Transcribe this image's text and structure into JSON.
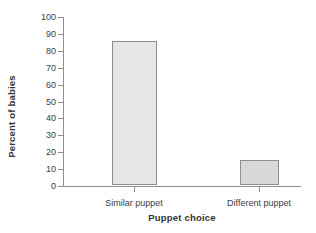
{
  "chart_data": {
    "type": "bar",
    "title": "",
    "xlabel": "Puppet choice",
    "ylabel": "Percent of babies",
    "categories": [
      "Similar puppet",
      "Different puppet"
    ],
    "values": [
      85,
      15
    ],
    "ylim": [
      0,
      100
    ],
    "yticks": [
      0,
      10,
      20,
      30,
      40,
      50,
      60,
      70,
      80,
      90,
      100
    ],
    "ytick_labels": [
      "0",
      "10",
      "20",
      "30",
      "40",
      "50",
      "60",
      "70",
      "80",
      "90",
      "100"
    ],
    "grid": false,
    "legend": false,
    "bar_colors": [
      "#e6e6e6",
      "#d8d8d8"
    ],
    "bar_edge_color": "#8e8e8e",
    "axis_color": "#8d8d8d",
    "text_color": "#3d3d3d",
    "background": "#ffffff"
  }
}
